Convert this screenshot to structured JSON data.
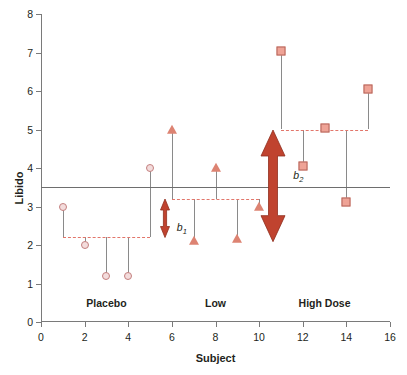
{
  "chart_data": {
    "type": "scatter",
    "title": "",
    "xlabel": "Subject",
    "ylabel": "Libido",
    "xlim": [
      0,
      16
    ],
    "ylim": [
      0,
      8
    ],
    "xticks": [
      0,
      2,
      4,
      6,
      8,
      10,
      12,
      14,
      16
    ],
    "yticks": [
      0,
      1,
      2,
      3,
      4,
      5,
      6,
      7,
      8
    ],
    "grid": false,
    "legend": "none",
    "x": [
      1,
      2,
      3,
      4,
      5,
      6,
      7,
      8,
      9,
      10,
      11,
      12,
      13,
      14,
      15
    ],
    "values": [
      3.0,
      2.0,
      1.2,
      1.2,
      4.0,
      5.0,
      2.1,
      4.0,
      2.15,
      3.0,
      7.05,
      4.05,
      5.05,
      3.12,
      6.05
    ],
    "series": [
      {
        "name": "Placebo",
        "marker": "circle",
        "color": "#f3dcdc",
        "edge_color": "#c4807f",
        "x": [
          1,
          2,
          3,
          4,
          5
        ],
        "values": [
          3.0,
          2.0,
          1.2,
          1.2,
          4.0
        ],
        "group_mean": 2.2,
        "group_label": "Placebo",
        "label_x": 3,
        "mean_span": [
          1,
          5
        ]
      },
      {
        "name": "Low",
        "marker": "triangle",
        "color": "#dd8372",
        "edge_color": "#b4655a",
        "x": [
          6,
          7,
          8,
          9,
          10
        ],
        "values": [
          5.0,
          2.1,
          4.0,
          2.15,
          3.0
        ],
        "group_mean": 3.2,
        "group_label": "Low",
        "label_x": 8,
        "mean_span": [
          6,
          10
        ]
      },
      {
        "name": "High Dose",
        "marker": "square",
        "color": "#efa396",
        "edge_color": "#b4655a",
        "x": [
          11,
          12,
          13,
          14,
          15
        ],
        "values": [
          7.05,
          4.05,
          5.05,
          3.12,
          6.05
        ],
        "group_mean": 5.0,
        "group_label": "High Dose",
        "label_x": 13,
        "mean_span": [
          11,
          15
        ]
      }
    ],
    "grand_mean": 3.5,
    "grand_mean_label": "",
    "annotations": [
      {
        "name": "b1",
        "label": "b",
        "subscript": "1",
        "x": 5.7,
        "y_from": 2.2,
        "y_to": 3.2,
        "color": "#c0432f",
        "thickness": "thin"
      },
      {
        "name": "b2",
        "label": "b",
        "subscript": "2",
        "x": 10.65,
        "y_from": 2.1,
        "y_to": 5.0,
        "color": "#c0432f",
        "thickness": "thick"
      }
    ],
    "group_captions_y": 0.42,
    "colors": {
      "axis": "#7a7a7a",
      "stem": "#8a8a8a",
      "grand_mean_line": "#6e6e6e",
      "group_mean_line": "#e2766b",
      "arrow": "#c0432f",
      "text": "#231f20"
    }
  }
}
